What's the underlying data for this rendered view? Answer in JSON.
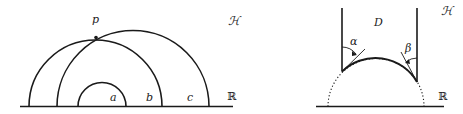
{
  "left_panel": {
    "labels": {
      "point": "p",
      "space": "ℋ",
      "real_line": "ℝ",
      "geodesic_a": "a",
      "geodesic_b": "b",
      "geodesic_c": "c"
    },
    "baseline_y": 106,
    "arcs": [
      {
        "name": "geodesic-a",
        "cx": 102,
        "r": 24
      },
      {
        "name": "geodesic-b",
        "cx": 95.5,
        "r": 66.5
      },
      {
        "name": "geodesic-c",
        "cx": 133,
        "r": 76
      }
    ],
    "intersection_point": {
      "x": 96,
      "y": 38
    }
  },
  "right_panel": {
    "labels": {
      "domain": "D",
      "space": "ℋ",
      "real_line": "ℝ",
      "angle_left": "α",
      "angle_right": "β"
    },
    "baseline_y": 106,
    "semicircle": {
      "cx": 376,
      "r": 48
    },
    "vertical_left_x": 342,
    "vertical_right_x": 417
  },
  "colors": {
    "stroke": "#1a1a1a",
    "background": "#ffffff"
  }
}
